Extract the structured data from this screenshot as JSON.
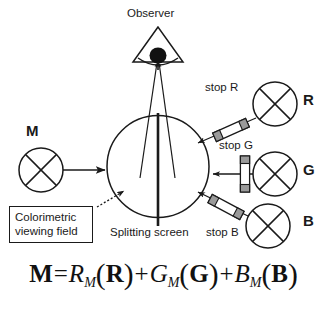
{
  "figure": {
    "background_color": "#ffffff",
    "line_color": "#1a1a1a",
    "stop_fill_color": "#9a9a9a",
    "stop_body_color": "#ffffff"
  },
  "labels": {
    "observer": "Observer",
    "stop_r": "stop R",
    "stop_g": "stop G",
    "stop_b": "stop B",
    "splitting_screen": "Splitting screen",
    "colorimetric_line1": "Colorimetric",
    "colorimetric_line2": "viewing field"
  },
  "sources": {
    "m": {
      "label": "M",
      "name": "match-stimulus-lamp"
    },
    "r": {
      "label": "R",
      "name": "red-primary-lamp"
    },
    "g": {
      "label": "G",
      "name": "green-primary-lamp"
    },
    "b": {
      "label": "B",
      "name": "blue-primary-lamp"
    }
  },
  "equation": {
    "lhs": "M",
    "equals": "=",
    "terms": [
      {
        "coefficient": "R",
        "subscript": "M",
        "vector": "R"
      },
      {
        "coefficient": "G",
        "subscript": "M",
        "vector": "G"
      },
      {
        "coefficient": "B",
        "subscript": "M",
        "vector": "B"
      }
    ],
    "plus": "+",
    "open_paren": "(",
    "close_paren": ")",
    "full_text": "M = R_M(R) + G_M(G) + B_M(B)"
  },
  "icons": {
    "lamp": "lamp-circle-cross-icon",
    "eye": "eye-filled-circle-icon",
    "observer_cone": "observer-cone-icon",
    "stop_bar": "optical-stop-bar-icon",
    "arrow": "beam-arrow-icon",
    "leader": "dotted-leader-line-icon"
  }
}
